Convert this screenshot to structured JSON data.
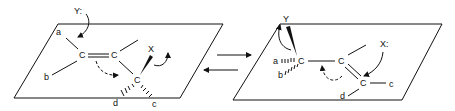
{
  "diagram": {
    "type": "reaction-mechanism",
    "colors": {
      "ink": "#111111",
      "background": "#ffffff"
    },
    "left": {
      "plane": "parallelogram",
      "nucleophile": "Y:",
      "leaving_group": "X",
      "carbons": [
        "C",
        "C",
        "C"
      ],
      "substituents": {
        "a": "a",
        "b": "b",
        "c": "c",
        "d": "d"
      }
    },
    "right": {
      "plane": "parallelogram",
      "nucleophile": "Y",
      "leaving_group": "X:",
      "carbons": [
        "C",
        "C",
        "C"
      ],
      "substituents": {
        "a": "a",
        "b": "b",
        "c": "c",
        "d": "d"
      }
    },
    "equilibrium": {
      "forward": "→",
      "reverse": "←"
    }
  }
}
